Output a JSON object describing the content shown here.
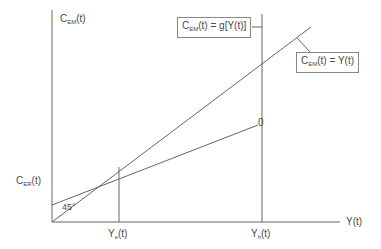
{
  "diagram": {
    "type": "economic consumption-income diagram",
    "y_axis_label": {
      "main": "C",
      "sub": "EM",
      "suffix": "(t)"
    },
    "x_axis_label": "Y(t)",
    "intercept_label": {
      "main": "C",
      "sub": "ER",
      "suffix": "(t)"
    },
    "angle_label": "45°",
    "equilibrium_income_label": {
      "main": "Y",
      "sub": "e",
      "suffix": "(t)"
    },
    "high_income_label": {
      "main": "Y",
      "sub": "h",
      "suffix": "(t)"
    },
    "point_marker": "0",
    "consumption_function_box": {
      "main": "C",
      "sub": "EM",
      "suffix": "(t) = g[Y(t)]"
    },
    "identity_line_box": {
      "main": "C",
      "sub": "EM",
      "suffix": "(t) = Y(t)"
    },
    "colors": {
      "lines": "#666666",
      "text": "#4a4a4a",
      "box_border": "#888888"
    }
  }
}
